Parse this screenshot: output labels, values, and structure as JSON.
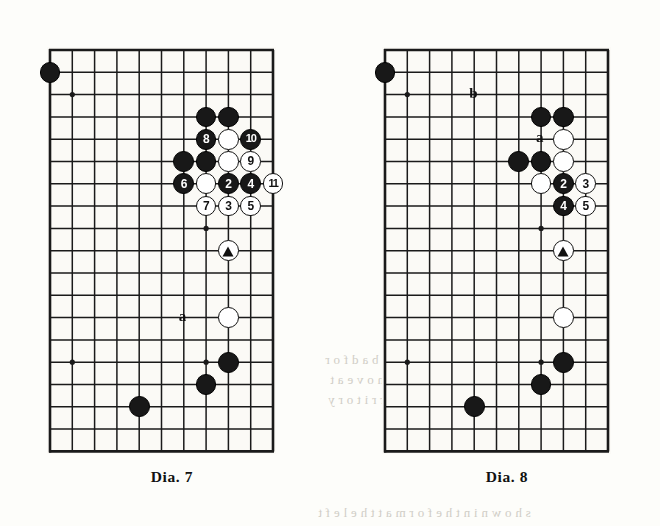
{
  "page": {
    "background": "#fdfdfa",
    "ghost_text": [
      {
        "text": "a , n o t , w o u l d   b e   b a d   f o r",
        "x": 325,
        "y": 352
      },
      {
        "text": "o l l o w   w i t h   a   m o v e   a t",
        "x": 330,
        "y": 372
      },
      {
        "text": "n g   t h e   c o r n e r   t e r r i t o r y",
        "x": 328,
        "y": 392
      },
      {
        "text": "s h o w n   i n   t h e   f o r m   a t   t h e   l e f t",
        "x": 318,
        "y": 505
      }
    ]
  },
  "board_geometry": {
    "cols": 11,
    "rows": 19,
    "cell": 22.3,
    "stone_radius": 10.4,
    "line_color": "#1a1a1a",
    "board_color": "#fbfaf6",
    "edge_line_width": 2.6,
    "inner_line_width": 1.5,
    "star_radius": 2.6
  },
  "diagrams": [
    {
      "id": "dia7",
      "caption": "Dia. 7",
      "origin": {
        "x": 50,
        "y": 50
      },
      "caption_pos": {
        "x": 52,
        "y": 468
      },
      "star_points": [
        {
          "col": 2,
          "row": 3
        },
        {
          "col": 2,
          "row": 15
        },
        {
          "col": 8,
          "row": 9
        },
        {
          "col": 8,
          "row": 15
        }
      ],
      "stones": [
        {
          "color": "black",
          "col": 1,
          "row": 2,
          "label": ""
        },
        {
          "color": "black",
          "col": 8,
          "row": 4,
          "label": ""
        },
        {
          "color": "black",
          "col": 9,
          "row": 4,
          "label": ""
        },
        {
          "color": "black",
          "col": 8,
          "row": 5,
          "label": "8"
        },
        {
          "color": "white",
          "col": 9,
          "row": 5,
          "label": ""
        },
        {
          "color": "black",
          "col": 10,
          "row": 5,
          "label": "10"
        },
        {
          "color": "black",
          "col": 7,
          "row": 6,
          "label": ""
        },
        {
          "color": "black",
          "col": 8,
          "row": 6,
          "label": ""
        },
        {
          "color": "white",
          "col": 9,
          "row": 6,
          "label": ""
        },
        {
          "color": "white",
          "col": 10,
          "row": 6,
          "label": "9"
        },
        {
          "color": "black",
          "col": 7,
          "row": 7,
          "label": "6"
        },
        {
          "color": "white",
          "col": 8,
          "row": 7,
          "label": ""
        },
        {
          "color": "black",
          "col": 9,
          "row": 7,
          "label": "2"
        },
        {
          "color": "black",
          "col": 10,
          "row": 7,
          "label": "4"
        },
        {
          "color": "white",
          "col": 11,
          "row": 7,
          "label": "11"
        },
        {
          "color": "white",
          "col": 8,
          "row": 8,
          "label": "7"
        },
        {
          "color": "white",
          "col": 9,
          "row": 8,
          "label": "3"
        },
        {
          "color": "white",
          "col": 10,
          "row": 8,
          "label": "5"
        },
        {
          "color": "white",
          "col": 9,
          "row": 10,
          "label": "",
          "mark": "triangle"
        },
        {
          "color": "white",
          "col": 9,
          "row": 13,
          "label": ""
        },
        {
          "color": "black",
          "col": 9,
          "row": 15,
          "label": ""
        },
        {
          "color": "black",
          "col": 8,
          "row": 16,
          "label": ""
        },
        {
          "color": "black",
          "col": 5,
          "row": 17,
          "label": ""
        }
      ],
      "markers": [
        {
          "text": "a",
          "col": 7,
          "row": 13
        }
      ]
    },
    {
      "id": "dia8",
      "caption": "Dia. 8",
      "origin": {
        "x": 385,
        "y": 50
      },
      "caption_pos": {
        "x": 387,
        "y": 468
      },
      "star_points": [
        {
          "col": 2,
          "row": 3
        },
        {
          "col": 2,
          "row": 15
        },
        {
          "col": 8,
          "row": 9
        },
        {
          "col": 8,
          "row": 15
        }
      ],
      "stones": [
        {
          "color": "black",
          "col": 1,
          "row": 2,
          "label": ""
        },
        {
          "color": "black",
          "col": 8,
          "row": 4,
          "label": ""
        },
        {
          "color": "black",
          "col": 9,
          "row": 4,
          "label": ""
        },
        {
          "color": "white",
          "col": 9,
          "row": 5,
          "label": ""
        },
        {
          "color": "black",
          "col": 7,
          "row": 6,
          "label": ""
        },
        {
          "color": "black",
          "col": 8,
          "row": 6,
          "label": ""
        },
        {
          "color": "white",
          "col": 9,
          "row": 6,
          "label": ""
        },
        {
          "color": "white",
          "col": 8,
          "row": 7,
          "label": ""
        },
        {
          "color": "black",
          "col": 9,
          "row": 7,
          "label": "2"
        },
        {
          "color": "white",
          "col": 10,
          "row": 7,
          "label": "3"
        },
        {
          "color": "black",
          "col": 9,
          "row": 8,
          "label": "4"
        },
        {
          "color": "white",
          "col": 10,
          "row": 8,
          "label": "5"
        },
        {
          "color": "white",
          "col": 9,
          "row": 10,
          "label": "",
          "mark": "triangle"
        },
        {
          "color": "white",
          "col": 9,
          "row": 13,
          "label": ""
        },
        {
          "color": "black",
          "col": 9,
          "row": 15,
          "label": ""
        },
        {
          "color": "black",
          "col": 8,
          "row": 16,
          "label": ""
        },
        {
          "color": "black",
          "col": 5,
          "row": 17,
          "label": ""
        }
      ],
      "markers": [
        {
          "text": "b",
          "col": 5,
          "row": 3
        },
        {
          "text": "a",
          "col": 8,
          "row": 5
        }
      ]
    }
  ]
}
